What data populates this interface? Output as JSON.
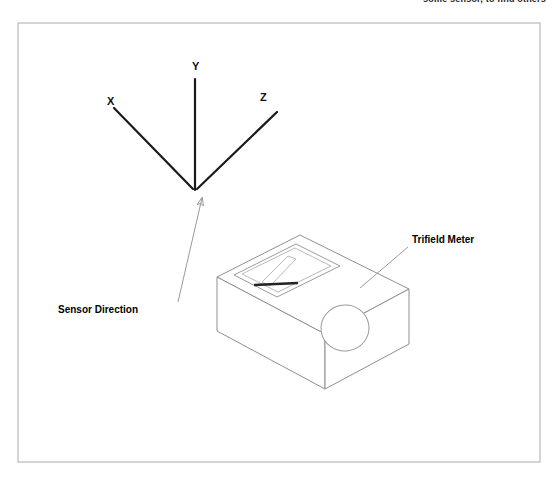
{
  "page": {
    "width": 558,
    "height": 479,
    "background": "#ffffff"
  },
  "caption": {
    "text": "some sensor, to find others",
    "color": "#1a1a1a"
  },
  "frame": {
    "name": "diagram-border",
    "x": 18,
    "y": 23,
    "width": 522,
    "height": 439,
    "stroke": "#b9b9b9"
  },
  "axes": {
    "origin": {
      "x": 195,
      "y": 191
    },
    "stroke": "#1a1a1a",
    "items": [
      {
        "label": "X",
        "label_x": 107,
        "label_y": 105,
        "x1": 114,
        "y1": 108,
        "x2": 193,
        "y2": 189
      },
      {
        "label": "Y",
        "label_x": 192,
        "label_y": 70,
        "x1": 195,
        "y1": 79,
        "x2": 195,
        "y2": 190
      },
      {
        "label": "Z",
        "label_x": 260,
        "label_y": 101,
        "x1": 277,
        "y1": 112,
        "x2": 197,
        "y2": 189
      }
    ]
  },
  "callouts": [
    {
      "name": "sensor-direction",
      "label": "Sensor Direction",
      "label_x": 58,
      "label_y": 313,
      "leader_x1": 178,
      "leader_y1": 302,
      "leader_x2": 202,
      "leader_y2": 198,
      "arrow": true,
      "stroke": "#9a9a9a"
    },
    {
      "name": "trifield-meter",
      "label": "Trifield Meter",
      "label_x": 412,
      "label_y": 243,
      "leader_x1": 408,
      "leader_y1": 247,
      "leader_x2": 360,
      "leader_y2": 288,
      "arrow": false,
      "stroke": "#9a9a9a"
    }
  ],
  "meter": {
    "name": "trifield-meter-body",
    "stroke": "#8f8f8f",
    "top_face": "217,277 300,235 409,289 325,334",
    "left_face": "217,277 217,331 325,389 325,334",
    "right_face": "325,334 325,389 409,344 409,289",
    "display": {
      "name": "meter-display-panel",
      "outer": "234,275 296,244 340,266 277,297",
      "inner": "242,274 295,248 331,266 278,292",
      "needle_sweep": "262,282 288,256 296,259 270,286",
      "needle_x1": 254,
      "needle_y1": 285,
      "needle_x2": 298,
      "needle_y2": 283,
      "needle_color": "#222222"
    },
    "dial": {
      "name": "meter-dial-knob",
      "cx": 345,
      "cy": 328,
      "rx": 24,
      "ry": 23,
      "rotation": -8
    }
  }
}
